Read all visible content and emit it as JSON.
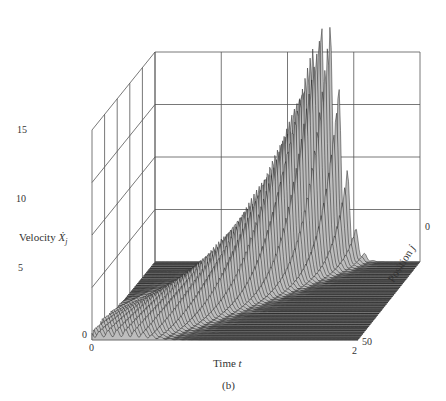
{
  "chart_data": {
    "type": "surface3d",
    "title": "",
    "caption": "(b)",
    "xlabel": "Time t",
    "ylabel": "Position j",
    "zlabel": "Velocity Ẋj",
    "x_ticks": [
      "0",
      "2"
    ],
    "y_ticks": [
      "0",
      "50"
    ],
    "z_ticks": [
      "0",
      "5",
      "10",
      "15"
    ],
    "xlim": [
      0,
      2
    ],
    "ylim": [
      0,
      50
    ],
    "zlim": [
      0,
      20
    ],
    "grid": true,
    "peak": {
      "t": 1.3,
      "j": 0,
      "velocity": 17
    },
    "ridge_profile": [
      {
        "t": 0.3,
        "j": 45,
        "velocity": 1.5
      },
      {
        "t": 0.5,
        "j": 38,
        "velocity": 3
      },
      {
        "t": 0.7,
        "j": 30,
        "velocity": 5
      },
      {
        "t": 0.9,
        "j": 22,
        "velocity": 7
      },
      {
        "t": 1.1,
        "j": 12,
        "velocity": 9
      },
      {
        "t": 1.2,
        "j": 6,
        "velocity": 11
      },
      {
        "t": 1.3,
        "j": 0,
        "velocity": 17
      }
    ]
  },
  "labels": {
    "velocity": "Velocity",
    "velocity_sym": "Ẋ",
    "velocity_sub": "j",
    "time": "Time",
    "time_sym": "t",
    "position": "Position",
    "position_sym": "j",
    "caption": "(b)"
  }
}
